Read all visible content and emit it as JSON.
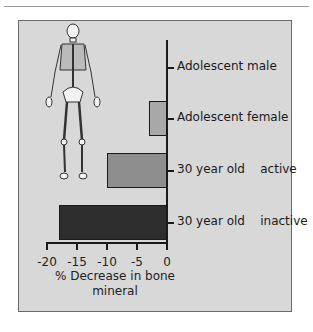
{
  "chart_data": {
    "type": "bar",
    "orientation": "horizontal",
    "title": "",
    "categories": [
      "Adolescent male",
      "Adolescent female",
      "30 year old    active",
      "30 year old    inactive"
    ],
    "values": [
      0,
      -3,
      -10,
      -18
    ],
    "bar_colors": [
      "#d8d8d8",
      "#a8a8a8",
      "#8e8e8e",
      "#2e2e2e"
    ],
    "xlabel": "% Decrease in bone mineral",
    "xlabel_lines": [
      "% Decrease in bone",
      "mineral"
    ],
    "ylabel": "",
    "xlim": [
      -20,
      0
    ],
    "xticks": [
      -20,
      -15,
      -10,
      -5,
      0
    ],
    "xtick_labels": [
      "-20",
      "-15",
      "-10",
      "-5",
      "0"
    ],
    "grid": false,
    "legend": null,
    "annotations": [
      "skeleton illustration"
    ]
  },
  "colors": {
    "panel_background": "#d8d8d8",
    "axis": "#1a1a1a"
  }
}
